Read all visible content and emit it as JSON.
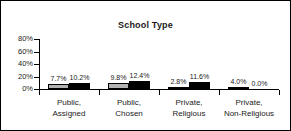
{
  "chart_data": {
    "type": "bar",
    "title": "School Type",
    "xlabel": "",
    "ylabel": "",
    "ylim": [
      0,
      80
    ],
    "ytick_labels": [
      "80%",
      "60%",
      "40%",
      "20%",
      "0%"
    ],
    "ytick_values": [
      80,
      60,
      40,
      20,
      0
    ],
    "grid": false,
    "legend": "none",
    "categories": [
      "Public, Assigned",
      "Public, Chosen",
      "Private, Religious",
      "Private, Non-Religious"
    ],
    "category_lines": [
      [
        "Public,",
        "Assigned"
      ],
      [
        "Public,",
        "Chosen"
      ],
      [
        "Private,",
        "Religious"
      ],
      [
        "Private,",
        "Non-Religious"
      ]
    ],
    "series": [
      {
        "name": "series-a",
        "color": "#b3b3b3",
        "values": [
          7.7,
          9.8,
          2.8,
          4.0
        ],
        "labels": [
          "7.7%",
          "9.8%",
          "2.8%",
          "4.0%"
        ]
      },
      {
        "name": "series-b",
        "color": "#000000",
        "values": [
          10.2,
          12.4,
          11.6,
          0.0
        ],
        "labels": [
          "10.2%",
          "12.4%",
          "11.6%",
          "0.0%"
        ]
      }
    ]
  },
  "colors": {
    "border": "#000000",
    "axis": "#000000",
    "text": "#1a1a1a",
    "series_a": "#b3b3b3",
    "series_b": "#000000",
    "background": "#ffffff"
  }
}
